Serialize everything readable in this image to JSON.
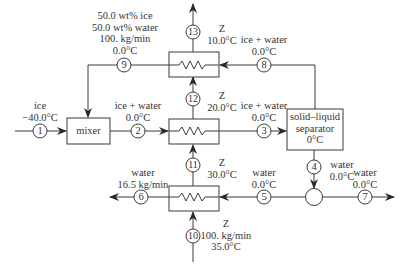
{
  "diagram": {
    "type": "process-flowchart",
    "units": [
      {
        "id": "mixer",
        "label": "mixer"
      },
      {
        "id": "separator",
        "lines": [
          "solid–liquid",
          "separator",
          "0°C"
        ]
      },
      {
        "id": "hx-top"
      },
      {
        "id": "hx-middle"
      },
      {
        "id": "hx-bottom"
      },
      {
        "id": "splitter-junction"
      }
    ],
    "streams": [
      {
        "num": "1",
        "lines": [
          "ice",
          "−40.0°C"
        ]
      },
      {
        "num": "2",
        "lines": [
          "ice + water",
          "0.0°C"
        ]
      },
      {
        "num": "3",
        "lines": [
          "ice + water",
          "0.0°C"
        ]
      },
      {
        "num": "4",
        "lines": [
          "water",
          "0.0°C"
        ]
      },
      {
        "num": "5",
        "lines": [
          "water",
          "0.0°C"
        ]
      },
      {
        "num": "6",
        "lines": [
          "water",
          "16.5 kg/min"
        ]
      },
      {
        "num": "7",
        "lines": [
          "water",
          "0.0°C"
        ]
      },
      {
        "num": "8",
        "lines": [
          "ice + water",
          "0.0°C"
        ]
      },
      {
        "num": "9",
        "lines": [
          "50.0 wt% ice",
          "50.0 wt% water",
          "100. kg/min",
          "0.0°C"
        ]
      },
      {
        "num": "10",
        "lines": [
          "Z",
          "100. kg/min",
          "35.0°C"
        ]
      },
      {
        "num": "11",
        "lines": [
          "Z",
          "30.0°C"
        ]
      },
      {
        "num": "12",
        "lines": [
          "Z",
          "20.0°C"
        ]
      },
      {
        "num": "13",
        "lines": [
          "Z",
          "10.0°C"
        ]
      }
    ],
    "colors": {
      "line": "#3a3a3a",
      "background": "#ffffff"
    }
  }
}
